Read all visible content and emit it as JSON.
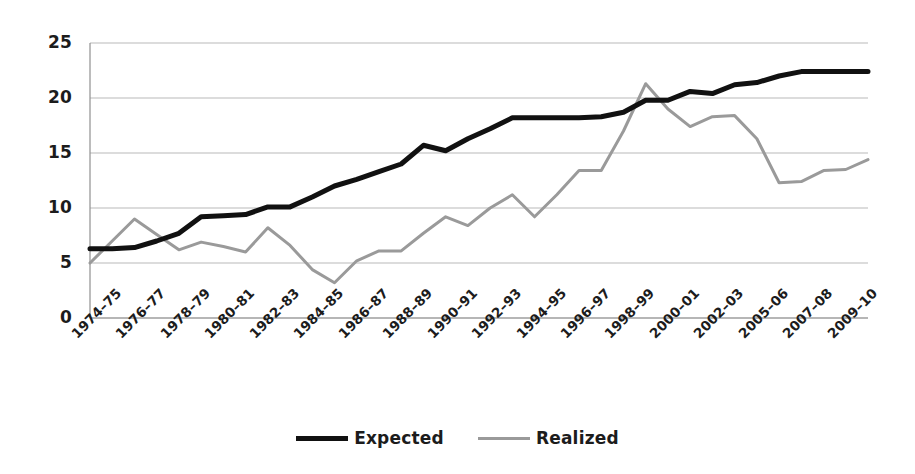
{
  "chart_data": {
    "type": "line",
    "title": "",
    "subtitle": "",
    "xlabel": "",
    "ylabel": "",
    "ylim": [
      0,
      25
    ],
    "yticks": [
      "0",
      "5",
      "10",
      "15",
      "20",
      "25"
    ],
    "grid": true,
    "legend_position": "bottom-center",
    "categories": [
      "1974–75",
      "1975–76",
      "1976–77",
      "1977–78",
      "1978–79",
      "1979–80",
      "1980–81",
      "1981–82",
      "1982–83",
      "1983–84",
      "1984–85",
      "1985–86",
      "1986–87",
      "1987–88",
      "1988–89",
      "1989–90",
      "1990–91",
      "1991–92",
      "1992–93",
      "1993–94",
      "1994–95",
      "1995–96",
      "1996–97",
      "1997–98",
      "1998–99",
      "1999–00",
      "2000–01",
      "2001–02",
      "2002–03",
      "2004–05",
      "2005–06",
      "2006–07",
      "2007–08",
      "2008–09",
      "2009–10",
      "2010–11"
    ],
    "xtick_labels": [
      "1974–75",
      "1976–77",
      "1978–79",
      "1980–81",
      "1982–83",
      "1984–85",
      "1986–87",
      "1988–89",
      "1990–91",
      "1992–93",
      "1994–95",
      "1996–97",
      "1998–99",
      "2000–01",
      "2002–03",
      "2005–06",
      "2007–08",
      "2009–10"
    ],
    "series": [
      {
        "name": "Expected",
        "color": "#111111",
        "width": 5,
        "values": [
          6.3,
          6.3,
          6.4,
          7.0,
          7.7,
          9.2,
          9.3,
          9.4,
          10.1,
          10.1,
          11.0,
          12.0,
          12.6,
          13.3,
          14.0,
          15.7,
          15.2,
          16.3,
          17.2,
          18.2,
          18.2,
          18.2,
          18.2,
          18.3,
          18.7,
          19.8,
          19.8,
          20.6,
          20.4,
          21.2,
          21.4,
          22.0,
          22.4,
          22.4,
          22.4,
          22.4
        ]
      },
      {
        "name": "Realized",
        "color": "#9a9a9a",
        "width": 3,
        "values": [
          5.0,
          7.0,
          9.0,
          7.6,
          6.2,
          6.9,
          6.5,
          6.0,
          8.2,
          6.6,
          4.4,
          3.2,
          5.2,
          6.1,
          6.1,
          7.7,
          9.2,
          8.4,
          10.0,
          11.2,
          9.2,
          11.2,
          13.4,
          13.4,
          17.0,
          21.3,
          19.0,
          17.4,
          18.3,
          18.4,
          16.3,
          12.3,
          12.4,
          13.4,
          13.5,
          14.4
        ]
      }
    ]
  },
  "legend": {
    "entries": [
      {
        "label": "Expected",
        "style": "thick-black-line"
      },
      {
        "label": "Realized",
        "style": "thin-gray-line"
      }
    ]
  },
  "colors": {
    "expected": "#111111",
    "realized": "#9a9a9a",
    "grid": "#b9b9b9",
    "axis": "#8f8f8f",
    "text": "#1c1c1c",
    "background": "#ffffff"
  }
}
